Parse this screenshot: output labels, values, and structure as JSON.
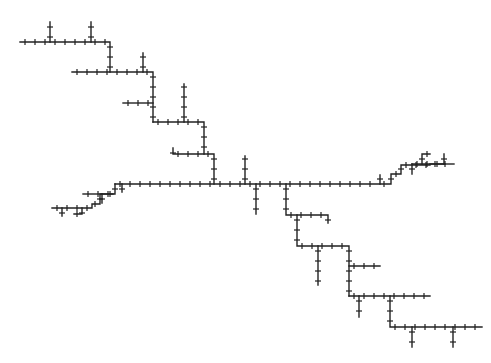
{
  "diagram": {
    "type": "branching-tree",
    "background": "#ffffff",
    "line_color": "#222222",
    "tick_spacing": 10,
    "tick_size": 3,
    "paths": [
      {
        "id": "top-row",
        "points": [
          [
            20,
            42
          ],
          [
            110,
            42
          ],
          [
            110,
            72
          ]
        ]
      },
      {
        "id": "top-branch-1",
        "points": [
          [
            50,
            42
          ],
          [
            50,
            22
          ]
        ]
      },
      {
        "id": "top-branch-2",
        "points": [
          [
            91,
            42
          ],
          [
            91,
            22
          ]
        ]
      },
      {
        "id": "row-2",
        "points": [
          [
            72,
            72
          ],
          [
            153,
            72
          ],
          [
            153,
            122
          ]
        ]
      },
      {
        "id": "row-2-branch",
        "points": [
          [
            143,
            72
          ],
          [
            143,
            53
          ]
        ]
      },
      {
        "id": "row-3-left",
        "points": [
          [
            123,
            103
          ],
          [
            153,
            103
          ]
        ]
      },
      {
        "id": "row-4",
        "points": [
          [
            153,
            122
          ],
          [
            204,
            122
          ],
          [
            204,
            154
          ]
        ]
      },
      {
        "id": "row-4-branch",
        "points": [
          [
            184,
            122
          ],
          [
            184,
            84
          ]
        ]
      },
      {
        "id": "row-5",
        "points": [
          [
            173,
            148
          ],
          [
            173,
            154
          ],
          [
            214,
            154
          ],
          [
            214,
            184
          ]
        ]
      },
      {
        "id": "main-trunk",
        "points": [
          [
            115,
            184
          ],
          [
            379,
            184
          ],
          [
            391,
            184
          ],
          [
            391,
            174
          ],
          [
            401,
            174
          ],
          [
            401,
            165
          ],
          [
            430,
            165
          ]
        ]
      },
      {
        "id": "main-branch-up-1",
        "points": [
          [
            245,
            184
          ],
          [
            245,
            156
          ]
        ]
      },
      {
        "id": "main-branch-down-1",
        "points": [
          [
            256,
            184
          ],
          [
            256,
            214
          ]
        ]
      },
      {
        "id": "main-branch-up-2",
        "points": [
          [
            380,
            184
          ],
          [
            380,
            175
          ]
        ]
      },
      {
        "id": "right-upper-1",
        "points": [
          [
            412,
            174
          ],
          [
            412,
            164
          ]
        ]
      },
      {
        "id": "right-upper-2",
        "points": [
          [
            412,
            164
          ],
          [
            445,
            164
          ]
        ]
      },
      {
        "id": "right-upper-3",
        "points": [
          [
            422,
            164
          ],
          [
            422,
            154
          ],
          [
            430,
            154
          ]
        ]
      },
      {
        "id": "right-upper-4",
        "points": [
          [
            444,
            164
          ],
          [
            444,
            154
          ]
        ]
      },
      {
        "id": "right-end",
        "points": [
          [
            430,
            164
          ],
          [
            454,
            164
          ]
        ]
      },
      {
        "id": "left-stair",
        "points": [
          [
            115,
            184
          ],
          [
            115,
            194
          ],
          [
            100,
            194
          ],
          [
            100,
            204
          ],
          [
            92,
            204
          ],
          [
            92,
            208
          ],
          [
            52,
            208
          ]
        ]
      },
      {
        "id": "left-stair-b1",
        "points": [
          [
            83,
            194
          ],
          [
            113,
            194
          ]
        ]
      },
      {
        "id": "left-stair-b2",
        "points": [
          [
            62,
            208
          ],
          [
            62,
            216
          ]
        ]
      },
      {
        "id": "left-stair-b3",
        "points": [
          [
            82,
            208
          ],
          [
            82,
            214
          ],
          [
            74,
            214
          ]
        ]
      },
      {
        "id": "left-stair-b4",
        "points": [
          [
            102,
            194
          ],
          [
            102,
            203
          ]
        ]
      },
      {
        "id": "left-stair-b5",
        "points": [
          [
            122,
            184
          ],
          [
            122,
            192
          ]
        ]
      },
      {
        "id": "mid-drop-1",
        "points": [
          [
            286,
            184
          ],
          [
            286,
            215
          ],
          [
            328,
            215
          ],
          [
            328,
            223
          ]
        ]
      },
      {
        "id": "mid-drop-2",
        "points": [
          [
            297,
            215
          ],
          [
            297,
            246
          ],
          [
            349,
            246
          ],
          [
            349,
            296
          ]
        ]
      },
      {
        "id": "mid-drop-2-branch",
        "points": [
          [
            318,
            246
          ],
          [
            318,
            285
          ]
        ]
      },
      {
        "id": "mid-drop-3",
        "points": [
          [
            349,
            266
          ],
          [
            380,
            266
          ]
        ]
      },
      {
        "id": "lower-row",
        "points": [
          [
            349,
            296
          ],
          [
            430,
            296
          ]
        ]
      },
      {
        "id": "lower-row-branch",
        "points": [
          [
            359,
            296
          ],
          [
            359,
            317
          ]
        ]
      },
      {
        "id": "lower-drop",
        "points": [
          [
            390,
            296
          ],
          [
            390,
            327
          ],
          [
            482,
            327
          ]
        ]
      },
      {
        "id": "bottom-branch-1",
        "points": [
          [
            412,
            327
          ],
          [
            412,
            347
          ]
        ]
      },
      {
        "id": "bottom-branch-2",
        "points": [
          [
            453,
            327
          ],
          [
            453,
            347
          ]
        ]
      }
    ]
  }
}
